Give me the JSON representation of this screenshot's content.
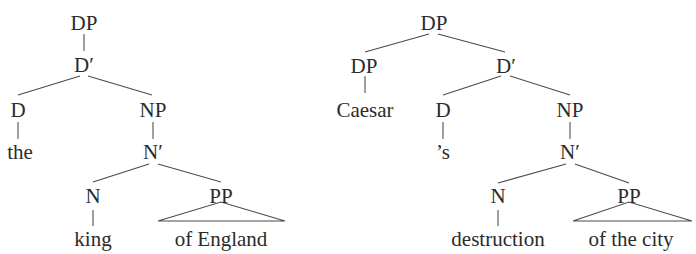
{
  "figure": {
    "background_color": "#ffffff",
    "line_color": "#4a4a4a",
    "text_color": "#2b2b2b"
  },
  "trees": [
    {
      "id": "tree-left",
      "gloss": "the king of England",
      "nodes": {
        "root": "DP",
        "dbar": "D′",
        "d": "D",
        "d_terminal": "the",
        "np": "NP",
        "nbar": "N′",
        "n": "N",
        "n_terminal": "king",
        "pp": "PP",
        "pp_terminal": "of England"
      }
    },
    {
      "id": "tree-right",
      "gloss": "Caesar's destruction of the city",
      "nodes": {
        "root": "DP",
        "spec_dp": "DP",
        "spec_terminal": "Caesar",
        "dbar": "D′",
        "d": "D",
        "d_terminal": "’s",
        "np": "NP",
        "nbar": "N′",
        "n": "N",
        "n_terminal": "destruction",
        "pp": "PP",
        "pp_terminal": "of the city"
      }
    }
  ]
}
